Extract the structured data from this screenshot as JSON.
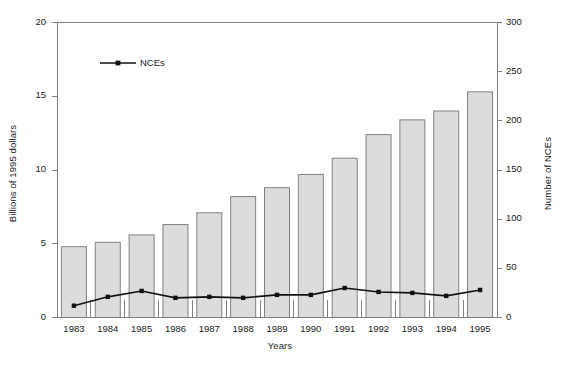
{
  "chart_data": {
    "type": "bar",
    "title": "",
    "subtitle": "",
    "xlabel": "Years",
    "ylabel": "Billions of 1995 dollars",
    "ylabel_right": "Number of NCEs",
    "categories": [
      "1983",
      "1984",
      "1985",
      "1986",
      "1987",
      "1988",
      "1989",
      "1990",
      "1991",
      "1992",
      "1993",
      "1994",
      "1995"
    ],
    "ylim": [
      0,
      20
    ],
    "yticks": [
      "0",
      "5",
      "10",
      "15",
      "20"
    ],
    "ytick_values": [
      0,
      5,
      10,
      15,
      20
    ],
    "ylim_right": [
      0,
      300
    ],
    "yticks_right": [
      "0",
      "50",
      "100",
      "150",
      "200",
      "250",
      "300"
    ],
    "ytick_values_right": [
      0,
      50,
      100,
      150,
      200,
      250,
      300
    ],
    "grid": false,
    "legend_position": "top-left-inside",
    "series": [
      {
        "name": "R&D spending",
        "kind": "bar",
        "axis": "left",
        "color": "#dcdcdc",
        "edge_color": "#808080",
        "values": [
          4.8,
          5.1,
          5.6,
          6.3,
          7.1,
          8.2,
          8.8,
          9.7,
          10.8,
          12.4,
          13.4,
          14.0,
          15.3
        ]
      },
      {
        "name": "NCEs",
        "kind": "line",
        "axis": "right",
        "color": "#111111",
        "marker": "square",
        "values": [
          12,
          21,
          27,
          20,
          21,
          20,
          23,
          23,
          30,
          26,
          25,
          22,
          28
        ]
      }
    ],
    "legend": [
      {
        "label": "NCEs",
        "marker": "line-square",
        "color": "#111111"
      }
    ]
  },
  "axes": {
    "frame_color": "#808080"
  }
}
